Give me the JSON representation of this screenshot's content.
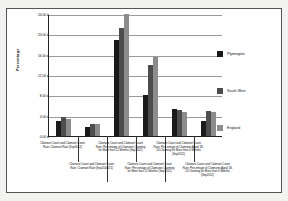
{
  "chart_data": {
    "type": "bar",
    "title": "",
    "xlabel": "",
    "ylabel": "Percentage",
    "ylim": [
      0,
      24
    ],
    "ytick_step": 4,
    "ytick_labels": [
      "0.00",
      "4.00",
      "8.00",
      "12.00",
      "16.00",
      "20.00",
      "24.00"
    ],
    "grid": true,
    "legend_position": "right",
    "categories": [
      "Claimant Count and Claimant Count Rate: Claimant Rate (Sep2012)",
      "Claimant Count and Claimant Count Rate: Claimant Rate (Sep2004/21)",
      "Claimant Count and Claimant Count Rate: Percentage of Claimants Claiming for More than 12 Months (Sep2012)",
      "Claimant Count and Claimant Count Rate: Percentage of Claimants Claiming for More than 12 Months (Sep2012)",
      "Claimant Count and Claimant Count Rate: Percentage of Claimants Aged 18-24 Claiming for More than 6 Months (Sep2012)",
      "Claimant Count and Claimant Count Rate: Percentage of Claimants Aged 18-24 Claiming for More than 6 Months (Sep2012)"
    ],
    "series": [
      {
        "name": "Plymington",
        "color": "#1a1a1a",
        "values": [
          3.0,
          1.8,
          18.8,
          8.0,
          5.4,
          3.0
        ]
      },
      {
        "name": "South West",
        "color": "#4d4d4d",
        "values": [
          3.7,
          2.3,
          21.2,
          14.0,
          5.2,
          5.0
        ]
      },
      {
        "name": "England",
        "color": "#8c8c8c",
        "values": [
          3.4,
          2.3,
          24.0,
          15.6,
          4.7,
          4.8
        ]
      }
    ]
  },
  "legend": {
    "items": [
      {
        "label": "Plymington",
        "color": "#1a1a1a"
      },
      {
        "label": "South West",
        "color": "#4d4d4d"
      },
      {
        "label": "England",
        "color": "#8c8c8c"
      }
    ]
  },
  "axes": {
    "y_title": "Percentage"
  }
}
